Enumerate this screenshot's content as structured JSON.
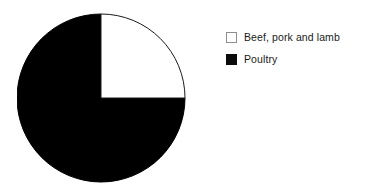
{
  "background_color": "#ffffff",
  "chart_data": {
    "type": "pie",
    "title": "",
    "subtitle": "",
    "xlabel": "",
    "ylabel": "",
    "grid": false,
    "legend_position": "right",
    "start_angle_deg": 0,
    "direction": "clockwise",
    "categories": [
      "Beef, pork and lamb",
      "Poultry"
    ],
    "values": [
      25,
      75
    ],
    "value_unit": "percent",
    "colors": [
      "#ffffff",
      "#000000"
    ],
    "slices": [
      {
        "label": "Beef, pork and lamb",
        "value": 25,
        "percent": "25%",
        "color": "#ffffff",
        "outline_color": "#1a1a1a",
        "quadrant": "top-right"
      },
      {
        "label": "Poultry",
        "value": 75,
        "percent": "75%",
        "color": "#000000",
        "outline_color": "#000000",
        "quadrant": "remaining-three-quarters"
      }
    ],
    "annotations": []
  },
  "pie": {
    "center_x": 84,
    "center_y": 85,
    "radius": 84,
    "white_wedge_path": "M 84 85 L 84 1 A 84 84 0 0 1 168 85 Z",
    "black_wedge_path": "M 84 85 L 168 85 A 84 84 0 1 1 84 1 Z",
    "stroke_color": "#1a1a1a",
    "stroke_width": "1"
  },
  "legend": {
    "items": [
      {
        "label": "Beef, pork and lamb",
        "swatch_name": "legend-swatch-beef-pork-and-lamb",
        "swatch_fill": "#ffffff",
        "swatch_border": "#8d8d8d"
      },
      {
        "label": "Poultry",
        "swatch_name": "legend-swatch-poultry",
        "swatch_fill": "#000000",
        "swatch_border": "#000000"
      }
    ]
  }
}
